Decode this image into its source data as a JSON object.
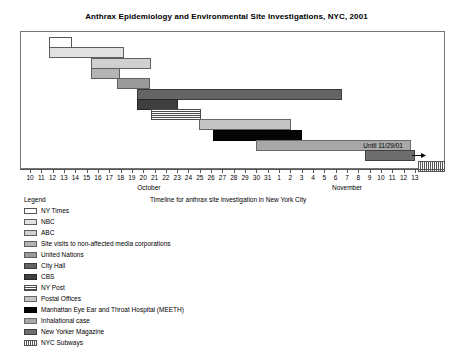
{
  "chart_title": "Anthrax Epidemiology and Environmental Site Investigations, NYC, 2001",
  "axis_caption": "Timeline for anthrax site investigation in New York City",
  "legend_title": "Legend",
  "annotation": {
    "until_label": "Until 11/29/01",
    "arrow_icon": "right-arrow-icon"
  },
  "chart_data": {
    "type": "bar",
    "subtype": "gantt",
    "title": "Anthrax Epidemiology and Environmental Site Investigations, NYC, 2001",
    "xlabel": "Timeline for anthrax site investigation in New York City",
    "ylabel": "",
    "grid": false,
    "legend_position": "below-left",
    "x_axis": {
      "months": [
        {
          "name": "October",
          "days": [
            10,
            11,
            12,
            13,
            14,
            15,
            16,
            17,
            18,
            19,
            20,
            21,
            22,
            23,
            24,
            25,
            26,
            27,
            28,
            29,
            30,
            31
          ]
        },
        {
          "name": "November",
          "days": [
            1,
            2,
            3,
            4,
            5,
            6,
            7,
            8,
            9,
            10,
            11,
            12,
            13
          ]
        }
      ],
      "tick_labels": [
        "10",
        "11",
        "12",
        "13",
        "14",
        "15",
        "16",
        "17",
        "18",
        "19",
        "20",
        "21",
        "22",
        "23",
        "24",
        "25",
        "26",
        "27",
        "28",
        "29",
        "30",
        "31",
        "1",
        "2",
        "3",
        "4",
        "5",
        "6",
        "7",
        "8",
        "9",
        "10",
        "11",
        "12",
        "13"
      ],
      "range_start_index": 0,
      "range_end_index": 34
    },
    "series": [
      {
        "name": "NY Times",
        "fill": "f-white",
        "color": "#ffffff",
        "start_index": 1.6,
        "end_index": 3.6,
        "row": 0,
        "open_ended": false
      },
      {
        "name": "NBC",
        "fill": "f-nbc",
        "color": "#e2e2e2",
        "start_index": 1.6,
        "end_index": 8.2,
        "row": 1,
        "open_ended": false
      },
      {
        "name": "ABC",
        "fill": "f-abc",
        "color": "#d0d0d0",
        "start_index": 5.3,
        "end_index": 10.6,
        "row": 2,
        "open_ended": false
      },
      {
        "name": "Site visits to non-affected media corporations",
        "fill": "f-sitevisit",
        "color": "#b4b4b4",
        "start_index": 5.3,
        "end_index": 7.9,
        "row": 3,
        "open_ended": false
      },
      {
        "name": "United Nations",
        "fill": "f-un",
        "color": "#9a9a9a",
        "start_index": 7.6,
        "end_index": 10.5,
        "row": 4,
        "open_ended": false
      },
      {
        "name": "City Hall",
        "fill": "f-cityhall",
        "color": "#646464",
        "start_index": 9.4,
        "end_index": 27.5,
        "row": 5,
        "open_ended": false
      },
      {
        "name": "CBS",
        "fill": "f-cbs",
        "color": "#3f3f3f",
        "start_index": 9.4,
        "end_index": 13.0,
        "row": 6,
        "open_ended": false
      },
      {
        "name": "NY Post",
        "fill": "f-nypost",
        "color": "#4a4a4a",
        "start_index": 10.6,
        "end_index": 15.0,
        "row": 7,
        "open_ended": false
      },
      {
        "name": "Postal Offices",
        "fill": "f-postal",
        "color": "#c4c4c4",
        "start_index": 14.8,
        "end_index": 23.0,
        "row": 8,
        "open_ended": false
      },
      {
        "name": "Manhattan Eye Ear and Throat Hospital (MEETH)",
        "fill": "f-meeth",
        "color": "#050505",
        "start_index": 16.1,
        "end_index": 23.9,
        "row": 9,
        "open_ended": false
      },
      {
        "name": "Inhalational case",
        "fill": "f-inhal",
        "color": "#a8a8a8",
        "start_index": 19.9,
        "end_index": 33.6,
        "row": 10,
        "open_ended": true
      },
      {
        "name": "New Yorker Magazine",
        "fill": "f-newyorker",
        "color": "#6e6e6e",
        "start_index": 29.5,
        "end_index": 33.9,
        "row": 11,
        "open_ended": false
      },
      {
        "name": "NYC Subways",
        "fill": "f-subway",
        "color": "#555555",
        "start_index": 34.2,
        "end_index": 36.6,
        "row": 12,
        "open_ended": false
      }
    ]
  },
  "legend_items": [
    {
      "label": "NY Times",
      "fill": "f-white"
    },
    {
      "label": "NBC",
      "fill": "f-nbc"
    },
    {
      "label": "ABC",
      "fill": "f-abc"
    },
    {
      "label": "Site visits to non-affected media corporations",
      "fill": "f-sitevisit"
    },
    {
      "label": "United Nations",
      "fill": "f-un"
    },
    {
      "label": "City Hall",
      "fill": "f-cityhall"
    },
    {
      "label": "CBS",
      "fill": "f-cbs"
    },
    {
      "label": "NY Post",
      "fill": "f-nypost"
    },
    {
      "label": "Postal Offices",
      "fill": "f-postal"
    },
    {
      "label": "Manhattan Eye Ear and Throat Hospital (MEETH)",
      "fill": "f-meeth"
    },
    {
      "label": "Inhalational case",
      "fill": "f-inhal"
    },
    {
      "label": "New Yorker Magazine",
      "fill": "f-newyorker"
    },
    {
      "label": "NYC Subways",
      "fill": "f-subway"
    }
  ]
}
